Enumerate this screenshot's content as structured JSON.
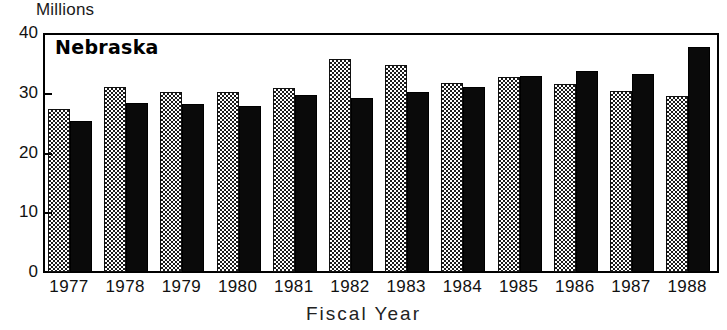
{
  "labels": {
    "unit_label": "Millions",
    "series_title": "Nebraska",
    "xlabel": "Fiscal Year"
  },
  "chart_data": {
    "type": "bar",
    "title": "Nebraska",
    "xlabel": "Fiscal Year",
    "ylabel": "Millions",
    "ylim": [
      0,
      40
    ],
    "yticks": [
      0,
      10,
      20,
      30,
      40
    ],
    "ytick_labels": [
      "0",
      "10",
      "20",
      "30",
      "40"
    ],
    "grid": false,
    "legend": "none",
    "categories": [
      "1977",
      "1978",
      "1979",
      "1980",
      "1981",
      "1982",
      "1983",
      "1984",
      "1985",
      "1986",
      "1987",
      "1988"
    ],
    "series": [
      {
        "name": "series-a",
        "style": "checkered-grey",
        "color": "#5a5a5a",
        "values": [
          27.3,
          31.0,
          30.2,
          30.1,
          30.8,
          35.6,
          34.6,
          31.7,
          32.7,
          31.5,
          30.3,
          29.5
        ]
      },
      {
        "name": "series-b",
        "style": "solid-black",
        "color": "#0a0a0a",
        "values": [
          25.2,
          28.3,
          28.1,
          27.8,
          29.6,
          29.2,
          30.1,
          31.0,
          32.8,
          33.6,
          33.2,
          37.7
        ]
      }
    ]
  }
}
